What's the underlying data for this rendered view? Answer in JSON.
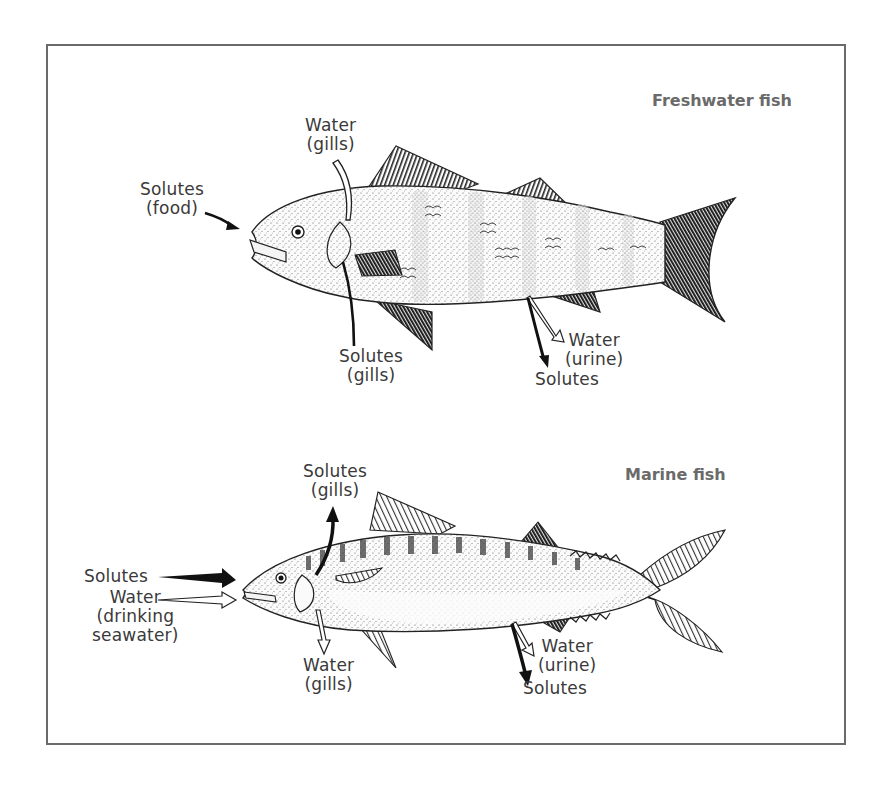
{
  "diagram": {
    "panels": [
      {
        "id": "freshwater",
        "title": "Freshwater fish",
        "labels": [
          {
            "id": "solutes-food",
            "lines": [
              "Solutes",
              "(food)"
            ],
            "arrow": "solid",
            "direction": "in"
          },
          {
            "id": "water-gills",
            "lines": [
              "Water",
              "(gills)"
            ],
            "arrow": "hollow",
            "direction": "in"
          },
          {
            "id": "solutes-gills",
            "lines": [
              "Solutes",
              "(gills)"
            ],
            "arrow": "solid",
            "direction": "out"
          },
          {
            "id": "water-urine",
            "lines": [
              "Water",
              "(urine)"
            ],
            "arrow": "hollow",
            "direction": "out"
          },
          {
            "id": "solutes-urine",
            "lines": [
              "Solutes"
            ],
            "arrow": "solid",
            "direction": "out"
          }
        ]
      },
      {
        "id": "marine",
        "title": "Marine fish",
        "labels": [
          {
            "id": "solutes-gills",
            "lines": [
              "Solutes",
              "(gills)"
            ],
            "arrow": "solid",
            "direction": "out"
          },
          {
            "id": "solutes-mouth",
            "lines": [
              "Solutes"
            ],
            "arrow": "solid",
            "direction": "in"
          },
          {
            "id": "water-drinking",
            "lines": [
              "Water",
              "(drinking",
              "seawater)"
            ],
            "arrow": "hollow",
            "direction": "in"
          },
          {
            "id": "water-gills",
            "lines": [
              "Water",
              "(gills)"
            ],
            "arrow": "hollow",
            "direction": "out"
          },
          {
            "id": "water-urine",
            "lines": [
              "Water",
              "(urine)"
            ],
            "arrow": "hollow",
            "direction": "out"
          },
          {
            "id": "solutes-urine",
            "lines": [
              "Solutes"
            ],
            "arrow": "solid",
            "direction": "out"
          }
        ]
      }
    ],
    "text": {
      "fw_title": "Freshwater fish",
      "fw_solutes_food": "Solutes\n(food)",
      "fw_water_gills": "Water\n(gills)",
      "fw_solutes_gills": "Solutes\n(gills)",
      "fw_water_urine": "Water\n(urine)",
      "fw_solutes_urine": "Solutes",
      "mf_title": "Marine fish",
      "mf_solutes_gills": "Solutes\n(gills)",
      "mf_solutes_in": "Solutes",
      "mf_water_drinking": "Water\n(drinking\nseawater)",
      "mf_water_gills": "Water\n(gills)",
      "mf_water_urine": "Water\n(urine)",
      "mf_solutes_urine": "Solutes"
    },
    "colors": {
      "frame": "#6a6a6a",
      "title": "#6a6a6a",
      "ink": "#1a1a1a",
      "label": "#3a3a3a"
    }
  }
}
